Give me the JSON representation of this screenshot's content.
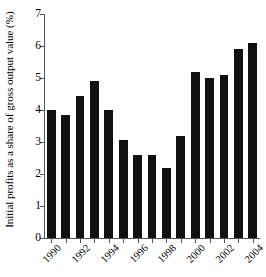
{
  "chart_data": {
    "type": "bar",
    "title": "",
    "subtitle": "",
    "xlabel": "",
    "ylabel": "Initial profits as a share of gross output value (%)",
    "ylim": [
      0,
      7
    ],
    "ytick_labels": [
      "0",
      "1",
      "2",
      "3",
      "4",
      "5",
      "6",
      "7"
    ],
    "ytick_values": [
      0,
      1,
      2,
      3,
      4,
      5,
      6,
      7
    ],
    "grid": false,
    "legend": null,
    "bar_color": "#111111",
    "axis_color": "#555555",
    "background_color": "#ffffff",
    "categories": [
      "1990",
      "1991",
      "1992",
      "1993",
      "1994",
      "1995",
      "1996",
      "1997",
      "1998",
      "1999",
      "2000",
      "2001",
      "2002",
      "2003",
      "2004"
    ],
    "xtick_labels": [
      "1990",
      "1992",
      "1994",
      "1996",
      "1998",
      "2000",
      "2002",
      "2004"
    ],
    "xtick_categories": [
      "1990",
      "1992",
      "1994",
      "1996",
      "1998",
      "2000",
      "2002",
      "2004"
    ],
    "values": [
      4.0,
      3.85,
      4.45,
      4.9,
      4.0,
      3.05,
      2.6,
      2.6,
      2.2,
      3.2,
      5.2,
      5.0,
      5.1,
      5.9,
      6.1
    ],
    "series": [
      {
        "name": "Initial profits as a share of gross output value",
        "values": [
          4.0,
          3.85,
          4.45,
          4.9,
          4.0,
          3.05,
          2.6,
          2.6,
          2.2,
          3.2,
          5.2,
          5.0,
          5.1,
          5.9,
          6.1
        ]
      }
    ]
  }
}
